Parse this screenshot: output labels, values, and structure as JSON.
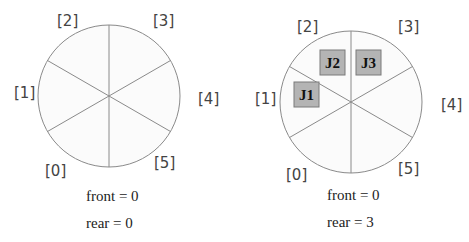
{
  "diagrams": [
    {
      "title": "empty-circular-queue",
      "index_labels": [
        "[0]",
        "[1]",
        "[2]",
        "[3]",
        "[4]",
        "[5]"
      ],
      "jobs": [],
      "front_text": "front = 0",
      "rear_text": "rear = 0"
    },
    {
      "title": "circular-queue-with-three-jobs",
      "index_labels": [
        "[0]",
        "[1]",
        "[2]",
        "[3]",
        "[4]",
        "[5]"
      ],
      "jobs": [
        "J1",
        "J2",
        "J3"
      ],
      "front_text": "front = 0",
      "rear_text": "rear = 3"
    }
  ],
  "colors": {
    "circle_fill": "#fbfbfb",
    "line": "#8a8a8a",
    "job_box": "#b4b4b4",
    "job_border": "#7a7a7a"
  }
}
